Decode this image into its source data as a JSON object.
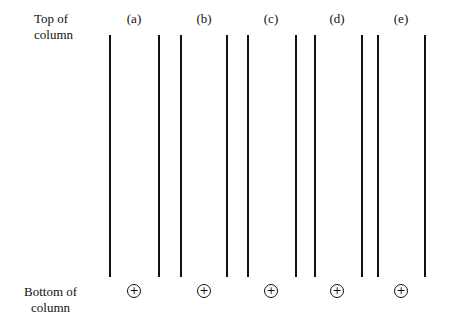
{
  "labels": {
    "top": [
      "Top of",
      "column"
    ],
    "bottom": [
      "Bottom of",
      "column"
    ]
  },
  "columns": [
    {
      "id": "a",
      "label": "(a)",
      "center": 134,
      "left_line": 110,
      "right_line": 159,
      "electrode": "+"
    },
    {
      "id": "b",
      "label": "(b)",
      "center": 204,
      "left_line": 181,
      "right_line": 227,
      "electrode": "+"
    },
    {
      "id": "c",
      "label": "(c)",
      "center": 271,
      "left_line": 248,
      "right_line": 296,
      "electrode": "+"
    },
    {
      "id": "d",
      "label": "(d)",
      "center": 337,
      "left_line": 315,
      "right_line": 362,
      "electrode": "+"
    },
    {
      "id": "e",
      "label": "(e)",
      "center": 401,
      "left_line": 378,
      "right_line": 425,
      "electrode": "+"
    }
  ]
}
